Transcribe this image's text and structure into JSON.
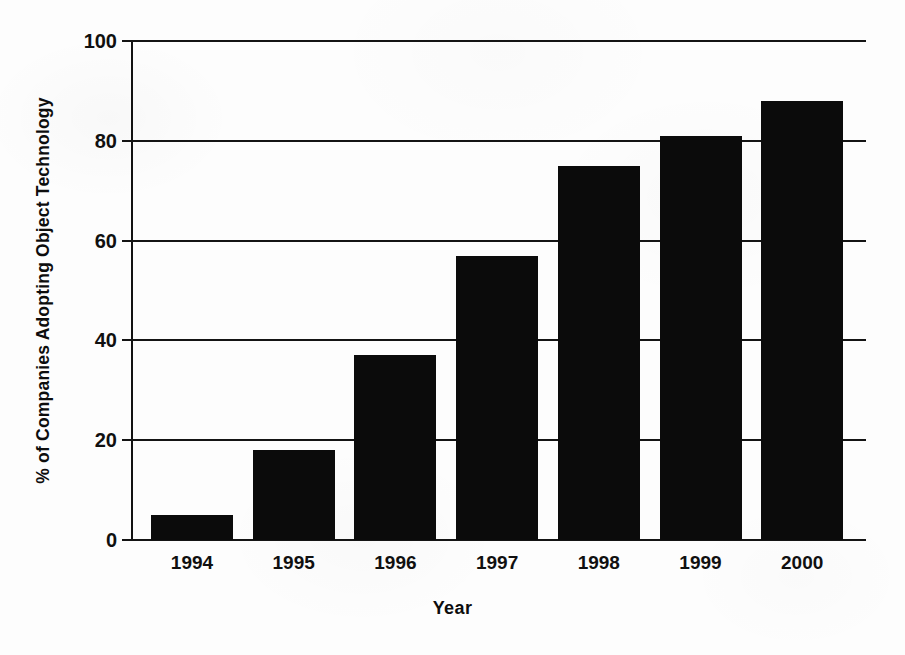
{
  "chart_data": {
    "type": "bar",
    "title": "",
    "subtitle": "",
    "xlabel": "Year",
    "ylabel": "% of Companies Adopting Object Technology",
    "categories": [
      "1994",
      "1995",
      "1996",
      "1997",
      "1998",
      "1999",
      "2000"
    ],
    "values": [
      5,
      18,
      37,
      57,
      75,
      81,
      88
    ],
    "series": [
      {
        "name": "% of Companies Adopting Object Technology",
        "values": [
          5,
          18,
          37,
          57,
          75,
          81,
          88
        ]
      }
    ],
    "ylim": [
      0,
      100
    ],
    "ytick_labels": [
      "0",
      "20",
      "40",
      "60",
      "80",
      "100"
    ],
    "ytick_values": [
      0,
      20,
      40,
      60,
      80,
      100
    ],
    "grid": "horizontal",
    "legend": "none",
    "bar_color": "#0b0b0b",
    "axis_color": "#141414",
    "background_color": "#fdfdfd",
    "annotations": []
  },
  "axes": {
    "y_title": "% of Companies Adopting Object Technology",
    "x_title": "Year"
  },
  "yticks": [
    {
      "label": "100",
      "value": 100
    },
    {
      "label": "80",
      "value": 80
    },
    {
      "label": "60",
      "value": 60
    },
    {
      "label": "40",
      "value": 40
    },
    {
      "label": "20",
      "value": 20
    },
    {
      "label": "0",
      "value": 0
    }
  ],
  "bars": [
    {
      "label": "1994",
      "value": 5
    },
    {
      "label": "1995",
      "value": 18
    },
    {
      "label": "1996",
      "value": 37
    },
    {
      "label": "1997",
      "value": 57
    },
    {
      "label": "1998",
      "value": 75
    },
    {
      "label": "1999",
      "value": 81
    },
    {
      "label": "2000",
      "value": 88
    }
  ]
}
